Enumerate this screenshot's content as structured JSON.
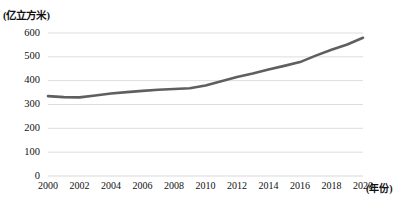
{
  "chart_data": {
    "type": "line",
    "title": "",
    "subtitle": "",
    "unit_label": "(亿立方米)",
    "xlabel": "(年份)",
    "ylabel": "",
    "grid": true,
    "legend": false,
    "legend_position": "none",
    "xlim": [
      2000,
      2020
    ],
    "ylim": [
      0,
      600
    ],
    "yticks": [
      0,
      100,
      200,
      300,
      400,
      500,
      600
    ],
    "ytick_labels": [
      "0",
      "100",
      "200",
      "300",
      "400",
      "500",
      "600"
    ],
    "xticks": [
      2000,
      2002,
      2004,
      2006,
      2008,
      2010,
      2012,
      2014,
      2016,
      2018,
      2020
    ],
    "xtick_labels": [
      "2000",
      "2002",
      "2004",
      "2006",
      "2008",
      "2010",
      "2012",
      "2014",
      "2016",
      "2018",
      "2020"
    ],
    "line_color": "#5f5f5f",
    "grid_color": "#d9d9d9",
    "series": [
      {
        "name": "供水总量",
        "x": [
          2000,
          2001,
          2002,
          2003,
          2004,
          2005,
          2006,
          2007,
          2008,
          2009,
          2010,
          2011,
          2012,
          2013,
          2014,
          2015,
          2016,
          2017,
          2018,
          2019,
          2020
        ],
        "values": [
          335,
          331,
          330,
          338,
          346,
          352,
          357,
          362,
          365,
          368,
          380,
          398,
          415,
          430,
          447,
          462,
          478,
          505,
          530,
          552,
          580
        ]
      }
    ]
  }
}
